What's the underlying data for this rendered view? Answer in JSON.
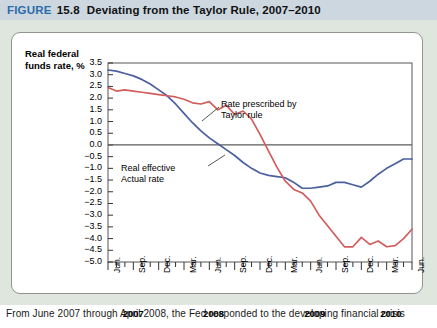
{
  "header": {
    "figure_word": "FIGURE",
    "figure_number": "15.8",
    "title": "Deviating from the Taylor Rule, 2007–2010",
    "band_color": "#ccd7e0",
    "figure_word_color": "#2c6ca8"
  },
  "caption": {
    "text": "From June 2007 through April 2008, the Fed responded to the developing financial crisis"
  },
  "annotations": {
    "taylor": "Rate prescribed by\nTaylor rule",
    "actual": "Real effective\nActual rate"
  },
  "chart_data": {
    "type": "line",
    "title": "Deviating from the Taylor Rule, 2007–2010",
    "xlabel": "",
    "ylabel": "Real federal\nfunds rate, %",
    "ylim": [
      -5.0,
      3.5
    ],
    "ytick_step": 0.5,
    "ytick_labels": [
      "3.5",
      "3.0",
      "2.5",
      "2.0",
      "1.5",
      "1.0",
      "0.5",
      "0.0",
      "−0.5",
      "−1.0",
      "−1.5",
      "−2.0",
      "−2.5",
      "−3.0",
      "−3.5",
      "−4.0",
      "−4.5",
      "−5.0"
    ],
    "ytick_values": [
      3.5,
      3.0,
      2.5,
      2.0,
      1.5,
      1.0,
      0.5,
      0.0,
      -0.5,
      -1.0,
      -1.5,
      -2.0,
      -2.5,
      -3.0,
      -3.5,
      -4.0,
      -4.5,
      -5.0
    ],
    "grid": false,
    "zero_line": true,
    "legend_position": "inline-annotations",
    "xtick_labels": [
      "Jun.",
      "Sep.",
      "Dec.",
      "Mar.",
      "Jun.",
      "Sep.",
      "Dec.",
      "Mar.",
      "Jun.",
      "Sep.",
      "Dec.",
      "Mar.",
      "Jun."
    ],
    "xtick_indices": [
      0,
      3,
      6,
      9,
      12,
      15,
      18,
      21,
      24,
      27,
      30,
      33,
      36
    ],
    "x": [
      "2007-06",
      "2007-07",
      "2007-08",
      "2007-09",
      "2007-10",
      "2007-11",
      "2007-12",
      "2008-01",
      "2008-02",
      "2008-03",
      "2008-04",
      "2008-05",
      "2008-06",
      "2008-07",
      "2008-08",
      "2008-09",
      "2008-10",
      "2008-11",
      "2008-12",
      "2009-01",
      "2009-02",
      "2009-03",
      "2009-04",
      "2009-05",
      "2009-06",
      "2009-07",
      "2009-08",
      "2009-09",
      "2009-10",
      "2009-11",
      "2009-12",
      "2010-01",
      "2010-02",
      "2010-03",
      "2010-04",
      "2010-05",
      "2010-06"
    ],
    "year_labels": [
      {
        "label": "2007",
        "start_index": 0,
        "end_index": 6
      },
      {
        "label": "2008",
        "start_index": 7,
        "end_index": 18
      },
      {
        "label": "2009",
        "start_index": 19,
        "end_index": 30
      },
      {
        "label": "2010",
        "start_index": 31,
        "end_index": 36
      }
    ],
    "series": [
      {
        "name": "Real effective Actual rate",
        "color": "#4a5f9e",
        "values": [
          3.2,
          3.15,
          3.05,
          2.95,
          2.8,
          2.6,
          2.35,
          2.1,
          1.75,
          1.35,
          0.95,
          0.6,
          0.3,
          0.05,
          -0.2,
          -0.45,
          -0.75,
          -1.0,
          -1.2,
          -1.3,
          -1.35,
          -1.4,
          -1.6,
          -1.85,
          -1.85,
          -1.8,
          -1.75,
          -1.6,
          -1.6,
          -1.7,
          -1.8,
          -1.55,
          -1.25,
          -1.0,
          -0.8,
          -0.6,
          -0.6
        ]
      },
      {
        "name": "Rate prescribed by Taylor rule",
        "color": "#d25d5d",
        "values": [
          2.45,
          2.3,
          2.35,
          2.3,
          2.25,
          2.2,
          2.15,
          2.1,
          2.05,
          1.95,
          1.8,
          1.75,
          1.85,
          1.5,
          1.7,
          1.3,
          1.45,
          1.1,
          0.45,
          -0.25,
          -0.95,
          -1.55,
          -1.9,
          -2.05,
          -2.4,
          -3.0,
          -3.45,
          -3.9,
          -4.35,
          -4.35,
          -3.95,
          -4.25,
          -4.1,
          -4.35,
          -4.3,
          -4.0,
          -3.6
        ]
      }
    ]
  }
}
